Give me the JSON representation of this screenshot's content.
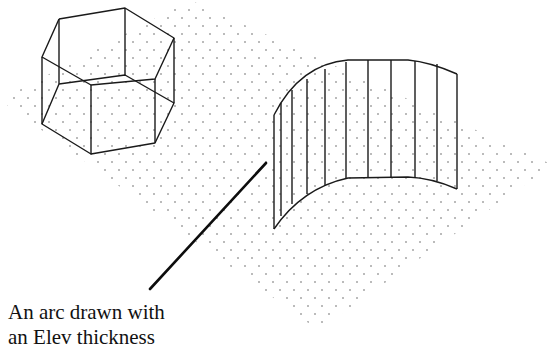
{
  "figure": {
    "type": "isometric-cad-illustration",
    "caption": {
      "line1": "An arc drawn with",
      "line2": "an Elev thickness"
    },
    "objects": [
      {
        "name": "hexagonal-prism",
        "description": "wireframe hexagon extruded with thickness"
      },
      {
        "name": "arc-surface",
        "description": "arc extruded with Elev thickness"
      }
    ],
    "grid": {
      "style": "isometric dots",
      "dot_color": "#555555"
    },
    "colors": {
      "background": "#ffffff",
      "lines": "#1a1a1a",
      "text": "#111111"
    }
  }
}
